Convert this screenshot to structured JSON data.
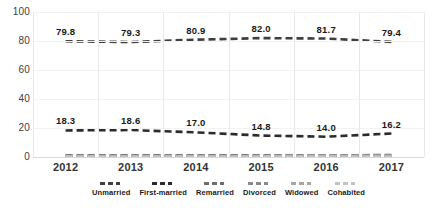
{
  "chart_data": {
    "type": "line",
    "title": "",
    "subtitle": "",
    "xlabel": "",
    "ylabel": "",
    "categories": [
      "2012",
      "2013",
      "2014",
      "2015",
      "2016",
      "2017"
    ],
    "ylim": [
      0,
      100
    ],
    "yticks": [
      "0",
      "20",
      "40",
      "60",
      "80",
      "100"
    ],
    "ytick_values": [
      0,
      20,
      40,
      60,
      80,
      100
    ],
    "grid": {
      "vertical": true,
      "horizontal": true
    },
    "legend_position": "bottom",
    "series": [
      {
        "name": "Unmarried",
        "color": "#3f3f3f",
        "style": "dashed",
        "values": [
          79.8,
          79.3,
          80.9,
          82.0,
          81.7,
          79.4
        ],
        "labels": [
          "79.8",
          "79.3",
          "80.9",
          "82.0",
          "81.7",
          "79.4"
        ],
        "labels_visible": true
      },
      {
        "name": "First-married",
        "color": "#2b2b2b",
        "style": "dashed",
        "values": [
          18.3,
          18.6,
          17.0,
          14.8,
          14.0,
          16.2
        ],
        "labels": [
          "18.3",
          "18.6",
          "17.0",
          "14.8",
          "14.0",
          "16.2"
        ],
        "labels_visible": true
      },
      {
        "name": "Remarried",
        "color": "#6e6e6e",
        "style": "dashed",
        "values": [
          1.1,
          1.1,
          1.1,
          1.2,
          1.2,
          1.3
        ],
        "labels": [
          "",
          "",
          "",
          "",
          "",
          ""
        ],
        "labels_visible": false
      },
      {
        "name": "Divorced",
        "color": "#8a8a8a",
        "style": "dashed",
        "values": [
          0.8,
          0.8,
          0.9,
          0.9,
          1.0,
          1.0
        ],
        "labels": [
          "",
          "",
          "",
          "",
          "",
          ""
        ],
        "labels_visible": false
      },
      {
        "name": "Widowed",
        "color": "#a6a6a6",
        "style": "dashed",
        "values": [
          0.5,
          0.5,
          0.5,
          0.5,
          0.6,
          0.6
        ],
        "labels": [
          "",
          "",
          "",
          "",
          "",
          ""
        ],
        "labels_visible": false
      },
      {
        "name": "Cohabited",
        "color": "#c2c2c2",
        "style": "dashed",
        "values": [
          0.3,
          0.3,
          0.3,
          0.3,
          0.3,
          0.3
        ],
        "labels": [
          "",
          "",
          "",
          "",
          "",
          ""
        ],
        "labels_visible": false
      }
    ]
  }
}
